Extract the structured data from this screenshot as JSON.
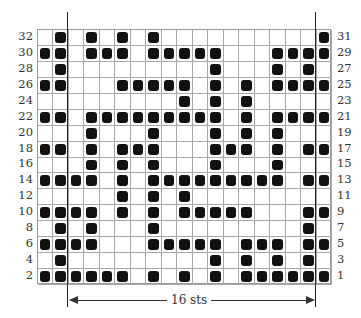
{
  "chart": {
    "columns": 19,
    "rows": 16,
    "repeat_label": "16 sts",
    "left_labels": [
      "32",
      "30",
      "28",
      "26",
      "24",
      "22",
      "20",
      "18",
      "16",
      "14",
      "12",
      "10",
      "8",
      "6",
      "4",
      "2"
    ],
    "right_labels": [
      "31",
      "29",
      "27",
      "25",
      "23",
      "21",
      "19",
      "17",
      "15",
      "13",
      "11",
      "9",
      "7",
      "5",
      "3",
      "1"
    ],
    "filled": [
      [
        1,
        3,
        5,
        7,
        18
      ],
      [
        0,
        1,
        3,
        4,
        5,
        7,
        8,
        9,
        10,
        11,
        15,
        16,
        17,
        18
      ],
      [
        1,
        11,
        15,
        17
      ],
      [
        0,
        1,
        5,
        6,
        7,
        8,
        9,
        11,
        13,
        15,
        16,
        17,
        18
      ],
      [
        9,
        11,
        13
      ],
      [
        0,
        1,
        3,
        4,
        5,
        6,
        7,
        8,
        9,
        10,
        11,
        13,
        15,
        16,
        17,
        18
      ],
      [
        3,
        7,
        11,
        13,
        15
      ],
      [
        0,
        1,
        3,
        5,
        6,
        7,
        11,
        12,
        13,
        15,
        17,
        18
      ],
      [
        3,
        5,
        7,
        11,
        15
      ],
      [
        0,
        1,
        2,
        3,
        5,
        7,
        8,
        9,
        10,
        11,
        12,
        13,
        14,
        15,
        17,
        18
      ],
      [
        5,
        7,
        9
      ],
      [
        0,
        1,
        2,
        3,
        5,
        7,
        9,
        10,
        11,
        12,
        13,
        17,
        18
      ],
      [
        1,
        3,
        7,
        17
      ],
      [
        0,
        1,
        2,
        3,
        7,
        8,
        9,
        10,
        11,
        13,
        14,
        15,
        17,
        18
      ],
      [
        1,
        11,
        13,
        15,
        17
      ],
      [
        0,
        1,
        2,
        3,
        4,
        5,
        7,
        9,
        11,
        13,
        14,
        15,
        16,
        17,
        18
      ]
    ],
    "colors": {
      "filled": "#111111",
      "grid": "#a8a8a8",
      "line": "#222222"
    }
  }
}
